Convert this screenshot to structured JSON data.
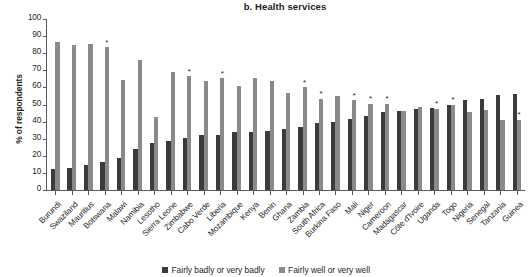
{
  "chart_data": {
    "type": "bar",
    "title": "b. Health services",
    "xlabel": "",
    "ylabel": "% of respondents",
    "ylim": [
      0,
      100
    ],
    "ytick_step": 10,
    "yticks": [
      100,
      90,
      80,
      70,
      60,
      50,
      40,
      30,
      20,
      10,
      0
    ],
    "grid": false,
    "legend_position": "bottom-center",
    "categories": [
      "Burundi",
      "Swaziland",
      "Mauritius",
      "Botswana",
      "Malawi",
      "Namibia",
      "Lesotho",
      "Sierra Leone",
      "Zimbabwe",
      "Cabo Verde",
      "Liberia",
      "Mozambique",
      "Kenya",
      "Benin",
      "Ghana",
      "Zambia",
      "South Africa",
      "Burkina Faso",
      "Mali",
      "Niger",
      "Cameroon",
      "Madagascar",
      "Côte d'Ivoire",
      "Uganda",
      "Togo",
      "Nigeria",
      "Senegal",
      "Tanzania",
      "Guinea"
    ],
    "series": [
      {
        "name": "Fairly badly or very badly",
        "color": "#3b3b3d",
        "values": [
          12,
          13,
          14.5,
          16.5,
          19,
          24,
          27.5,
          28.5,
          30.5,
          32,
          32,
          34,
          34,
          34.5,
          35.5,
          37,
          39,
          40,
          41.5,
          43.5,
          45.5,
          46.5,
          47.5,
          48,
          49.5,
          52.5,
          53,
          55.5,
          56
        ]
      },
      {
        "name": "Fairly well or very well",
        "color": "#8a8a8c",
        "values": [
          86.5,
          85,
          85.5,
          83.5,
          64.5,
          76,
          42.5,
          69,
          66.5,
          63.5,
          65.5,
          61,
          65.5,
          64,
          57,
          60,
          53.5,
          55,
          52.5,
          50.5,
          50.5,
          46.5,
          48.5,
          47.5,
          50,
          45.5,
          47,
          41,
          41
        ]
      }
    ],
    "annotations": {
      "symbol": "*",
      "starred_categories": [
        "Botswana",
        "Zimbabwe",
        "Liberia",
        "Zambia",
        "South Africa",
        "Mali",
        "Niger",
        "Cameroon",
        "Uganda",
        "Togo",
        "Guinea"
      ]
    }
  },
  "legend": {
    "items": [
      {
        "label": "Fairly badly or very badly"
      },
      {
        "label": "Fairly well or very well"
      }
    ]
  }
}
